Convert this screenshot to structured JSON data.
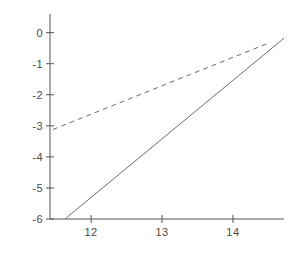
{
  "chart_data": {
    "type": "scatter",
    "title": "",
    "xlabel": "δi",
    "ylabel": "LOG Pi",
    "xlim": [
      11.42,
      14.72
    ],
    "ylim": [
      -6.0,
      0.6
    ],
    "xticks": [
      "12",
      "13",
      "14"
    ],
    "xtick_values": [
      12,
      13,
      14
    ],
    "yticks": [
      "0",
      "-1",
      "-2",
      "-3",
      "-4",
      "-5",
      "-6"
    ],
    "ytick_values": [
      0,
      -1,
      -2,
      -3,
      -4,
      -5,
      -6
    ],
    "grid": false,
    "legend": "none",
    "series": [
      {
        "name": "upper-correlation",
        "marker": "filled-circle",
        "fit_line": "dashed",
        "points": [
          {
            "label": "14",
            "x": 12.3,
            "y": -2.48,
            "label_dx": -13,
            "label_dy": -10
          },
          {
            "label": "15",
            "x": 12.6,
            "y": -1.82,
            "label_dx": -12,
            "label_dy": -11
          },
          {
            "label": "13",
            "x": 12.76,
            "y": -1.76,
            "label_dx": 0,
            "label_dy": -12
          },
          {
            "label": "12",
            "x": 13.08,
            "y": -1.27,
            "label_dx": -1,
            "label_dy": -13
          },
          {
            "label": "11",
            "x": 13.5,
            "y": -1.07,
            "label_dx": -1,
            "label_dy": -13
          },
          {
            "label": "10",
            "x": 13.88,
            "y": -0.96,
            "label_dx": 1,
            "label_dy": -13
          }
        ]
      },
      {
        "name": "lower-correlation",
        "marker": "filled-triangle",
        "fit_line": "solid",
        "points": [
          {
            "label": "22",
            "x": 12.03,
            "y": -5.16,
            "label_dx": 2,
            "label_dy": 14
          },
          {
            "label": "21",
            "x": 12.73,
            "y": -3.56,
            "label_dx": -10,
            "label_dy": 14
          },
          {
            "label": "18",
            "x": 12.73,
            "y": -3.36,
            "label_dx": 1,
            "label_dy": -13
          },
          {
            "label": "20",
            "x": 13.01,
            "y": -4.2,
            "label_dx": 0,
            "label_dy": 15
          },
          {
            "label": "19",
            "x": 13.35,
            "y": -3.86,
            "label_dx": 2,
            "label_dy": 15
          },
          {
            "label": "17",
            "x": 13.34,
            "y": -2.45,
            "label_dx": -6,
            "label_dy": -13
          },
          {
            "label": "16",
            "x": 13.74,
            "y": -1.73,
            "label_dx": 6,
            "label_dy": 0
          }
        ]
      }
    ],
    "highlight_point": {
      "label": "1,9",
      "x": 14.37,
      "y": -0.75,
      "marker": "boxed-filled-circle",
      "label_dx": 0,
      "label_dy": -12
    },
    "fit_lines": [
      {
        "name": "dashed-trend",
        "style": "dashed",
        "x1": 11.46,
        "y1": -3.12,
        "x2": 14.52,
        "y2": -0.32
      },
      {
        "name": "solid-trend",
        "style": "solid",
        "x1": 11.63,
        "y1": -6.0,
        "x2": 14.72,
        "y2": -0.18
      }
    ],
    "colors": {
      "marker": "#1a1a1a",
      "axis": "#555555",
      "fit": "#6b6b6b",
      "text": "#3a3a3a",
      "background": "#ffffff"
    }
  }
}
